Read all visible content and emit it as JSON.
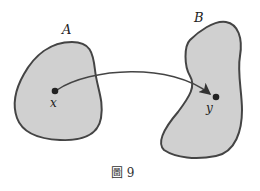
{
  "diagram": {
    "sets": [
      {
        "name": "A",
        "label": "A",
        "point": "x"
      },
      {
        "name": "B",
        "label": "B",
        "point": "y"
      }
    ],
    "arrow": {
      "from": "x",
      "to": "y"
    },
    "caption": "圖 9",
    "colors": {
      "fill": "#d0d0d0",
      "stroke": "#444444",
      "point": "#222222"
    }
  }
}
